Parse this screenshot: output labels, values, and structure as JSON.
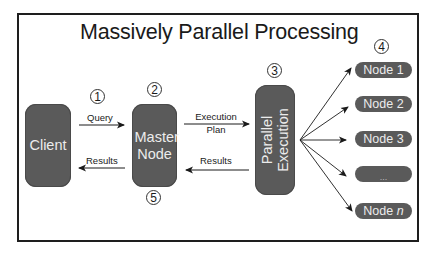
{
  "diagram": {
    "title": "Massively Parallel Processing",
    "components": {
      "client": {
        "label": "Client"
      },
      "master": {
        "label": "Master Node"
      },
      "parallel": {
        "label": "Parallel Execution"
      }
    },
    "nodes": [
      {
        "label": "Node 1"
      },
      {
        "label": "Node 2"
      },
      {
        "label": "Node 3"
      },
      {
        "label": "..."
      },
      {
        "label": "Node",
        "suffix": "n"
      }
    ],
    "edges": {
      "query": "Query",
      "results_to_client": "Results",
      "execution_plan_line1": "Execution",
      "execution_plan_line2": "Plan",
      "results_to_master": "Results"
    },
    "steps": [
      "1",
      "2",
      "3",
      "4",
      "5"
    ],
    "colors": {
      "box_fill": "#5a5a5a",
      "box_text": "#ececec",
      "border": "#1e1e1e"
    }
  }
}
